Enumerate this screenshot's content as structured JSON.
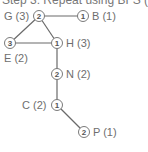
{
  "title": "Step 3: Repeat using BFS (1",
  "colors": {
    "edge": "#6a6a6a",
    "node_stroke": "#7a7a7a",
    "text": "#6e6e6e"
  },
  "nodes": [
    {
      "id": "G",
      "label": "G (3)",
      "value": "2"
    },
    {
      "id": "B",
      "label": "B (1)",
      "value": "1"
    },
    {
      "id": "E",
      "label": "E (2)",
      "value": "3"
    },
    {
      "id": "H",
      "label": "H (3)",
      "value": "1"
    },
    {
      "id": "N",
      "label": "N (2)",
      "value": "2"
    },
    {
      "id": "C",
      "label": "C (2)",
      "value": "1"
    },
    {
      "id": "P",
      "label": "P (1)",
      "value": "2"
    }
  ],
  "edges": [
    [
      "G",
      "B"
    ],
    [
      "G",
      "E"
    ],
    [
      "G",
      "H"
    ],
    [
      "E",
      "H"
    ],
    [
      "H",
      "N"
    ],
    [
      "N",
      "C"
    ],
    [
      "C",
      "P"
    ]
  ]
}
